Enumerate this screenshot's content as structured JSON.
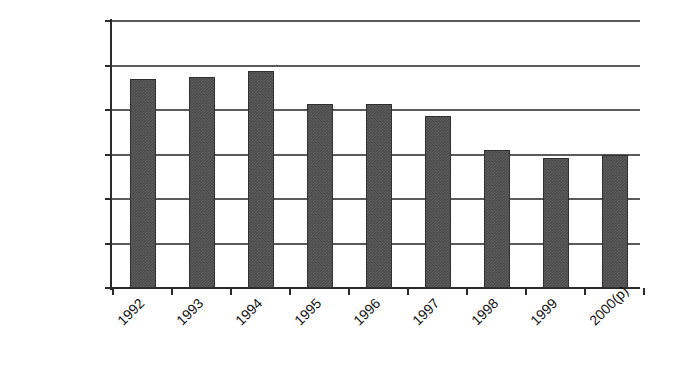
{
  "chart_data": {
    "type": "bar",
    "title": "",
    "subtitle": "",
    "xlabel": "",
    "ylabel": "Number of Homicides",
    "categories": [
      "1992",
      "1993",
      "1994",
      "1995",
      "1996",
      "1997",
      "1998",
      "1999",
      "2000(p)"
    ],
    "values": [
      940,
      950,
      975,
      825,
      825,
      775,
      620,
      585,
      600
    ],
    "series": [
      {
        "name": "Number of Homicides",
        "values": [
          940,
          950,
          975,
          825,
          825,
          775,
          620,
          585,
          600
        ]
      }
    ],
    "ylim": [
      0,
      1200
    ],
    "y_ticks": [
      0,
      200,
      400,
      600,
      800,
      1000,
      1200
    ],
    "y_tick_labels": [
      "0",
      "200",
      "400",
      "600",
      "800",
      "1000",
      "1200"
    ],
    "grid": true,
    "grid_axis": "y",
    "legend": false,
    "legend_position": "none",
    "bar_color": "#4b4b4b",
    "bar_edge_color": "#303030",
    "axis_color": "#2a2a2a",
    "gridline_color": "#5a5a5a",
    "background_color": "#ffffff",
    "x_tick_label_rotation": -45,
    "annotations": []
  }
}
